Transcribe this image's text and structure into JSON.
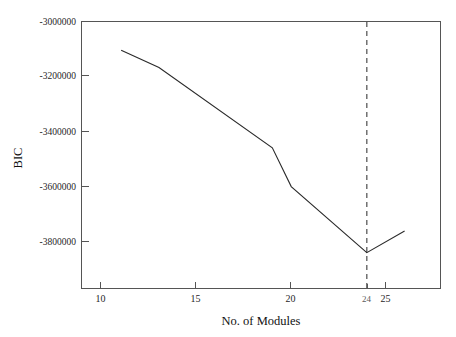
{
  "chart_data": {
    "type": "line",
    "title": "",
    "xlabel": "No. of Modules",
    "ylabel": "BIC",
    "x": [
      11,
      13,
      19,
      20,
      24,
      26
    ],
    "values": [
      -3100000,
      -3160000,
      -3440000,
      -3575000,
      -3805000,
      -3730000
    ],
    "series": [
      {
        "name": "BIC",
        "x": [
          11,
          13,
          19,
          20,
          24,
          26
        ],
        "values": [
          -3100000,
          -3160000,
          -3440000,
          -3575000,
          -3805000,
          -3730000
        ]
      }
    ],
    "xlim": [
      8.9,
      27.9
    ],
    "ylim": [
      -3930000,
      -3000000
    ],
    "xticks": [
      10,
      15,
      20,
      25
    ],
    "xticklabels": [
      "10",
      "15",
      "20",
      "25"
    ],
    "yticks": [
      -3000000,
      -3200000,
      -3400000,
      -3600000,
      -3800000
    ],
    "yticklabels": [
      "-3000000",
      "-3200000",
      "-3400000",
      "-3600000",
      "-3800000"
    ],
    "grid": false,
    "legend": null,
    "annotations": [
      {
        "type": "vertical-dashed-line",
        "x": 24,
        "label": "24",
        "note": "optimal number of modules at BIC minimum"
      }
    ],
    "line_color": "#2a2a2a",
    "annotation_color": "#5a5a5a",
    "axis_color": "#555555"
  },
  "axes": {
    "y_label": "BIC",
    "x_label": "No. of Modules",
    "y_tick_labels": [
      "-3000000",
      "-3200000",
      "-3400000",
      "-3600000",
      "-3800000"
    ],
    "x_tick_labels": [
      "10",
      "15",
      "20",
      "25"
    ],
    "marker_tick_label": "24"
  }
}
